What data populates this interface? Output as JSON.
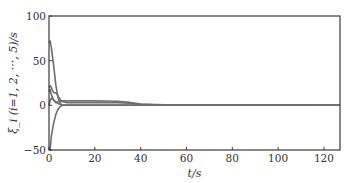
{
  "chart_data": {
    "type": "line",
    "title": "",
    "xlabel": "t/s",
    "ylabel": "ξ_i (i=1, 2, ···, 5)/s",
    "xlim": [
      0,
      127
    ],
    "ylim": [
      -50,
      100
    ],
    "xticks": [
      0,
      20,
      40,
      60,
      80,
      100,
      120
    ],
    "yticks": [
      -50,
      0,
      50,
      100
    ],
    "grid": false,
    "legend": null,
    "series": [
      {
        "name": "ξ1",
        "x": [
          0,
          0.5,
          1,
          2,
          3,
          4,
          5,
          6,
          8,
          10,
          20,
          30,
          35,
          40,
          50,
          127
        ],
        "y": [
          70,
          72,
          65,
          45,
          22,
          8,
          2,
          0,
          0,
          0,
          0,
          0,
          0,
          0,
          0,
          0
        ]
      },
      {
        "name": "ξ2",
        "x": [
          0,
          0.5,
          1,
          2,
          3,
          4,
          5,
          6,
          8,
          10,
          20,
          30,
          35,
          40,
          50,
          127
        ],
        "y": [
          20,
          22,
          20,
          14,
          14,
          10,
          6,
          4,
          3,
          3,
          3,
          3,
          2.5,
          1,
          0,
          0
        ]
      },
      {
        "name": "ξ3",
        "x": [
          0,
          0.5,
          1,
          2,
          3,
          4,
          5,
          6,
          8,
          10,
          20,
          30,
          35,
          40,
          50,
          127
        ],
        "y": [
          15,
          18,
          12,
          6,
          4,
          2,
          1,
          0,
          0,
          0,
          0,
          0,
          0,
          0,
          0,
          0
        ]
      },
      {
        "name": "ξ4",
        "x": [
          0,
          0.5,
          1,
          2,
          3,
          4,
          5,
          6,
          8,
          10,
          20,
          30,
          35,
          40,
          50,
          127
        ],
        "y": [
          -48,
          -50,
          -35,
          -20,
          -10,
          -4,
          -1,
          0,
          0,
          0,
          0,
          0,
          0,
          0,
          0,
          0
        ]
      },
      {
        "name": "ξ5",
        "x": [
          0,
          0.5,
          1,
          2,
          3,
          4,
          5,
          6,
          8,
          10,
          20,
          30,
          35,
          40,
          50,
          127
        ],
        "y": [
          0,
          5,
          8,
          6,
          3,
          4,
          5,
          5,
          5,
          5,
          5,
          4.5,
          3.5,
          1.5,
          0.5,
          0
        ]
      }
    ]
  },
  "colors": {
    "line": "#6e6e6e",
    "axis": "#3a3a3a",
    "text": "#333333"
  }
}
